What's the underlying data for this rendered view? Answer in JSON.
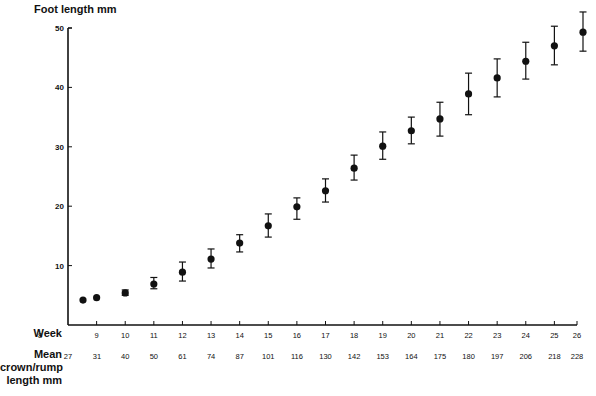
{
  "chart_data": {
    "type": "scatter",
    "title": "",
    "ylabel": "Foot length mm",
    "xlabel": "Week",
    "secondary_xlabel": "Mean crown/rump length mm",
    "ylim": [
      0,
      50
    ],
    "yticks": [
      10,
      20,
      30,
      40,
      50
    ],
    "xlim": [
      8,
      26
    ],
    "xticks": [
      8,
      9,
      10,
      11,
      12,
      13,
      14,
      15,
      16,
      17,
      18,
      19,
      20,
      21,
      22,
      23,
      24,
      25,
      26
    ],
    "crown_rump_labels": [
      {
        "x": 8.5,
        "label": "27"
      },
      {
        "x": 9,
        "label": "31"
      },
      {
        "x": 10,
        "label": "40"
      },
      {
        "x": 11,
        "label": "50"
      },
      {
        "x": 12,
        "label": "61"
      },
      {
        "x": 13,
        "label": "74"
      },
      {
        "x": 14,
        "label": "87"
      },
      {
        "x": 15,
        "label": "101"
      },
      {
        "x": 16,
        "label": "116"
      },
      {
        "x": 17,
        "label": "130"
      },
      {
        "x": 18,
        "label": "142"
      },
      {
        "x": 19,
        "label": "153"
      },
      {
        "x": 20,
        "label": "164"
      },
      {
        "x": 21,
        "label": "175"
      },
      {
        "x": 22,
        "label": "180"
      },
      {
        "x": 23,
        "label": "197"
      },
      {
        "x": 24,
        "label": "206"
      },
      {
        "x": 25,
        "label": "218"
      },
      {
        "x": 26,
        "label": "228"
      }
    ],
    "grid": false,
    "legend": null,
    "series": [
      {
        "name": "Mean foot length",
        "points": [
          {
            "week": 8.5,
            "crown_rump": 27,
            "mean": 4.2,
            "low": null,
            "high": null
          },
          {
            "week": 9,
            "crown_rump": 31,
            "mean": 4.6,
            "low": null,
            "high": null
          },
          {
            "week": 10,
            "crown_rump": 40,
            "mean": 5.4,
            "low": 5.0,
            "high": 5.9
          },
          {
            "week": 11,
            "crown_rump": 50,
            "mean": 6.9,
            "low": 6.1,
            "high": 8.0
          },
          {
            "week": 12,
            "crown_rump": 61,
            "mean": 8.9,
            "low": 7.4,
            "high": 10.6
          },
          {
            "week": 13,
            "crown_rump": 74,
            "mean": 11.1,
            "low": 9.6,
            "high": 12.8
          },
          {
            "week": 14,
            "crown_rump": 87,
            "mean": 13.8,
            "low": 12.3,
            "high": 15.2
          },
          {
            "week": 15,
            "crown_rump": 101,
            "mean": 16.7,
            "low": 14.8,
            "high": 18.7
          },
          {
            "week": 16,
            "crown_rump": 116,
            "mean": 19.9,
            "low": 17.8,
            "high": 21.4
          },
          {
            "week": 17,
            "crown_rump": 130,
            "mean": 22.6,
            "low": 20.7,
            "high": 24.6
          },
          {
            "week": 18,
            "crown_rump": 142,
            "mean": 26.4,
            "low": 24.4,
            "high": 28.6
          },
          {
            "week": 19,
            "crown_rump": 153,
            "mean": 30.1,
            "low": 27.9,
            "high": 32.5
          },
          {
            "week": 20,
            "crown_rump": 164,
            "mean": 32.7,
            "low": 30.5,
            "high": 35.0
          },
          {
            "week": 21,
            "crown_rump": 175,
            "mean": 34.7,
            "low": 31.8,
            "high": 37.5
          },
          {
            "week": 22,
            "crown_rump": 180,
            "mean": 38.9,
            "low": 35.4,
            "high": 42.4
          },
          {
            "week": 23,
            "crown_rump": 197,
            "mean": 41.6,
            "low": 38.4,
            "high": 44.8
          },
          {
            "week": 24,
            "crown_rump": 206,
            "mean": 44.4,
            "low": 41.4,
            "high": 47.6
          },
          {
            "week": 25,
            "crown_rump": 218,
            "mean": 47.0,
            "low": 43.8,
            "high": 50.3
          },
          {
            "week": 26,
            "crown_rump": 228,
            "mean": 49.3,
            "low": 46.1,
            "high": 52.7
          }
        ]
      }
    ]
  },
  "labels": {
    "y_title": "Foot length mm",
    "week_row": "Week",
    "crl_row_line1": "Mean",
    "crl_row_line2": "crown/rump",
    "crl_row_line3": "length mm"
  }
}
